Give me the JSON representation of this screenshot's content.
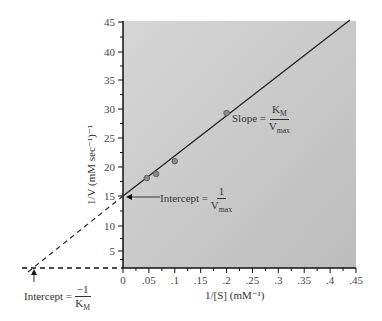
{
  "chart_data": {
    "type": "scatter",
    "title": "",
    "xlabel": "1/[S] (mM⁻¹)",
    "ylabel": "1/V (mM sec⁻¹)⁻¹",
    "xlim": [
      0,
      0.45
    ],
    "ylim": [
      0,
      45
    ],
    "x_ticks": [
      "0",
      ".05",
      ".1",
      ".15",
      ".2",
      ".25",
      ".3",
      ".35",
      ".4",
      ".45"
    ],
    "y_ticks": [
      "5",
      "10",
      "15",
      "20",
      "25",
      "30",
      "35",
      "40",
      "45"
    ],
    "series": [
      {
        "name": "data points",
        "x": [
          0.046,
          0.064,
          0.1,
          0.2
        ],
        "y": [
          18.1,
          18.8,
          21.0,
          29.3
        ]
      },
      {
        "name": "fit line",
        "x": [
          0,
          0.42
        ],
        "y": [
          15,
          45
        ]
      }
    ],
    "extrapolation": {
      "x_intercept": -0.18,
      "y_intercept": 15,
      "style": "dashed"
    },
    "annotations": [
      {
        "text": "Slope = K_M / V_max"
      },
      {
        "text": "Intercept = 1 / V_max"
      },
      {
        "text": "Intercept = −1 / K_M"
      }
    ],
    "grid": false,
    "background": "#c8c8c8"
  },
  "labels": {
    "slope_text": "Slope =",
    "slope_num": "K",
    "slope_num_sub": "M",
    "slope_den": "V",
    "slope_den_sub": "max",
    "yint_text": "Intercept =",
    "yint_num": "1",
    "yint_den": "V",
    "yint_den_sub": "max",
    "xint_text": "Intercept =",
    "xint_num": "−1",
    "xint_den": "K",
    "xint_den_sub": "M",
    "xlabel": "1/[S] (mM⁻¹)",
    "ylabel": "1/V (mM sec⁻¹)⁻¹"
  }
}
